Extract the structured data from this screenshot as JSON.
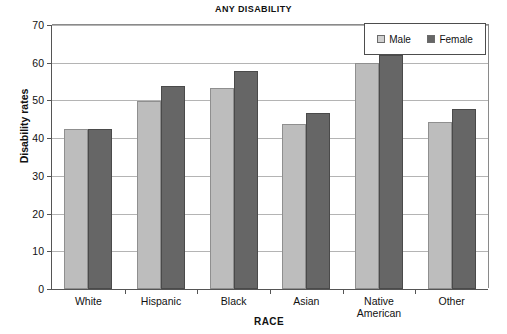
{
  "chart_data": {
    "type": "bar",
    "title": "ANY DISABILITY",
    "xlabel": "RACE",
    "ylabel": "Disability rates",
    "ylim": [
      0,
      70
    ],
    "ytick_step": 10,
    "yticks": [
      "0",
      "10",
      "20",
      "30",
      "40",
      "50",
      "60",
      "70"
    ],
    "grid": "horizontal",
    "legend_position": "top-right",
    "categories": [
      "White",
      "Hispanic",
      "Black",
      "Asian",
      "Native American",
      "Other"
    ],
    "category_labels": [
      "White",
      "Hispanic",
      "Black",
      "Asian",
      "Native\nAmerican",
      "Other"
    ],
    "series": [
      {
        "name": "Male",
        "color": "#bdbdbd",
        "values": [
          42.3,
          49.8,
          53.3,
          43.8,
          59.9,
          44.2
        ]
      },
      {
        "name": "Female",
        "color": "#666666",
        "values": [
          42.4,
          53.8,
          57.7,
          46.7,
          62.0,
          47.6
        ]
      }
    ]
  }
}
